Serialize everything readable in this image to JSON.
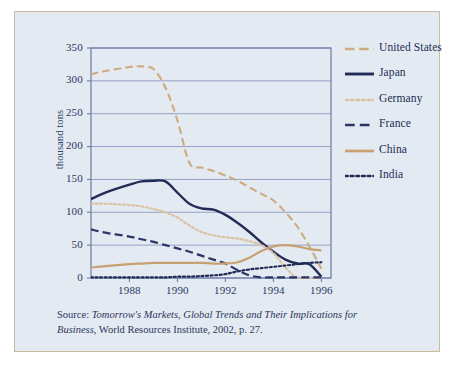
{
  "figure": {
    "panel_bg": "#e4eaf2",
    "panel_border": "#cbbba0",
    "source_prefix": "Source: ",
    "source_title": "Tomorrow's Markets, Global Trends and Their Implications for Business",
    "source_rest": ", World Resources Institute, 2002, p. 27."
  },
  "chart_data": {
    "type": "line",
    "title": "",
    "xlabel": "",
    "ylabel": "thousand tons",
    "xlim": [
      1986.4,
      1996.4
    ],
    "ylim": [
      0,
      350
    ],
    "ytick_labels": [
      "350",
      "300",
      "250",
      "200",
      "150",
      "100",
      "50",
      "0"
    ],
    "ytick_values": [
      350,
      300,
      250,
      200,
      150,
      100,
      50,
      0
    ],
    "xtick_labels": [
      "1988",
      "1990",
      "1992",
      "1994",
      "1996"
    ],
    "xtick_values": [
      1988,
      1990,
      1992,
      1994,
      1996
    ],
    "grid": "horizontal",
    "legend_position": "right",
    "x": [
      1986.4,
      1987,
      1988,
      1988.5,
      1989,
      1989.5,
      1990,
      1990.5,
      1991,
      1991.5,
      1992,
      1992.5,
      1993,
      1993.5,
      1994,
      1994.5,
      1995,
      1995.5,
      1996
    ],
    "series": [
      {
        "name": "United States",
        "color": "#cdab7e",
        "style": "dashed",
        "width": 2.1,
        "values": [
          310,
          315,
          321,
          322,
          318,
          290,
          240,
          175,
          168,
          163,
          156,
          148,
          138,
          128,
          118,
          100,
          78,
          48,
          14
        ]
      },
      {
        "name": "Japan",
        "color": "#222b55",
        "style": "solid",
        "width": 2.4,
        "values": [
          120,
          130,
          142,
          147,
          148,
          147,
          130,
          113,
          106,
          104,
          96,
          84,
          70,
          54,
          40,
          28,
          22,
          21,
          2
        ]
      },
      {
        "name": "Germany",
        "color": "#d8c4a3",
        "style": "dotted",
        "width": 2.2,
        "values": [
          113,
          113,
          111,
          109,
          105,
          100,
          92,
          80,
          70,
          65,
          62,
          60,
          56,
          50,
          38,
          16,
          0,
          0,
          0
        ]
      },
      {
        "name": "France",
        "color": "#2a3566",
        "style": "dashed",
        "width": 2.2,
        "values": [
          74,
          69,
          63,
          59,
          55,
          50,
          45,
          40,
          34,
          28,
          22,
          12,
          4,
          1,
          1,
          1,
          1,
          1,
          1
        ]
      },
      {
        "name": "China",
        "color": "#c8a172",
        "style": "solid",
        "width": 2.2,
        "values": [
          16,
          18,
          21,
          22,
          23,
          23,
          23,
          23,
          23,
          22,
          22,
          24,
          31,
          41,
          48,
          50,
          48,
          44,
          42
        ]
      },
      {
        "name": "India",
        "color": "#222b55",
        "style": "dotted",
        "width": 2.2,
        "values": [
          1,
          1,
          1,
          1,
          1,
          1,
          2,
          2,
          3,
          4,
          6,
          10,
          13,
          15,
          17,
          19,
          21,
          23,
          24
        ]
      }
    ]
  },
  "legend": {
    "items": [
      {
        "label": "United States"
      },
      {
        "label": "Japan"
      },
      {
        "label": "Germany"
      },
      {
        "label": "France"
      },
      {
        "label": "China"
      },
      {
        "label": "India"
      }
    ]
  }
}
